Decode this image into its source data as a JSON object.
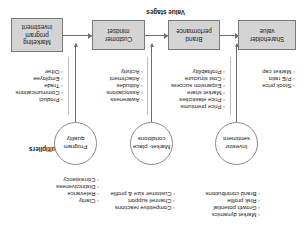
{
  "diagram": {
    "labels": {
      "value_stages": "Value stages",
      "multipliers": "Multipliers"
    },
    "stages": [
      {
        "id": "marketing-program-investment",
        "lines": [
          "Marketing",
          "program",
          "investment"
        ]
      },
      {
        "id": "customer-mindset",
        "lines": [
          "Customer",
          "mindset"
        ]
      },
      {
        "id": "brand-performance",
        "lines": [
          "Brand",
          "performance"
        ]
      },
      {
        "id": "shareholder-value",
        "lines": [
          "Shareholder",
          "value"
        ]
      }
    ],
    "stage_bullets": [
      {
        "id": "marketing-program-investment-bullets",
        "items": [
          "Product",
          "Communications",
          "Trade",
          "Employee",
          "Other"
        ]
      },
      {
        "id": "customer-mindset-bullets",
        "items": [
          "Awareness",
          "Associations",
          "Attitudes",
          "Attachment",
          "Activity"
        ]
      },
      {
        "id": "brand-performance-bullets",
        "items": [
          "Price premiums",
          "Price elasticities",
          "Market share",
          "Expansion success",
          "Cost structure",
          "Profitability"
        ]
      },
      {
        "id": "shareholder-value-bullets",
        "items": [
          "Stock price",
          "P/E ratio",
          "Market cap"
        ]
      }
    ],
    "multipliers": [
      {
        "id": "program-quality",
        "lines": [
          "Program",
          "quality"
        ]
      },
      {
        "id": "marketplace-conditions",
        "lines": [
          "Market-",
          "place",
          "conditions"
        ]
      },
      {
        "id": "investor-sentiment",
        "lines": [
          "Investor",
          "sentiment"
        ]
      }
    ],
    "multiplier_bullets": [
      {
        "id": "program-quality-bullets",
        "items": [
          "Clarity",
          "Relevance",
          "Distinctiveness",
          "Consistency"
        ]
      },
      {
        "id": "marketplace-conditions-bullets",
        "items": [
          "Competitive reactions",
          "Channel support",
          "Customer size & profile"
        ]
      },
      {
        "id": "investor-sentiment-bullets",
        "items": [
          "Market dynamics",
          "Growth potential",
          "Risk profile",
          "Brand contributions"
        ]
      }
    ],
    "bullet_marker": "◦",
    "colors": {
      "box_fill": "#d4d4d4",
      "box_border": "#7a7a7a",
      "circle_border": "#8a8a8a",
      "line": "#6e6e6e",
      "separator": "#bdbdbd",
      "text": "#1a1a1a"
    }
  }
}
